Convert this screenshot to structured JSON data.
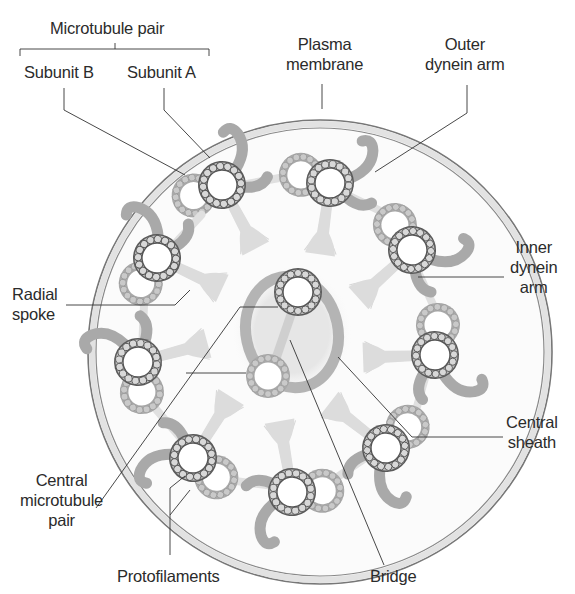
{
  "diagram": {
    "colors": {
      "membrane_fill": "#e6e6e6",
      "membrane_stroke": "#777777",
      "doublet_a_ring": "#555555",
      "doublet_b_ring": "#a8a8a8",
      "dynein_arm": "#a9a9a9",
      "spoke": "#dcdcdc",
      "leader_line": "#333333",
      "text": "#2b2b2b"
    },
    "labels": {
      "microtubule_pair": "Microtubule pair",
      "subunit_b": "Subunit B",
      "subunit_a": "Subunit A",
      "plasma_membrane": [
        "Plasma",
        "membrane"
      ],
      "outer_dynein_arm": [
        "Outer",
        "dynein arm"
      ],
      "inner_dynein_arm": [
        "Inner",
        "dynein",
        "arm"
      ],
      "radial_spoke": [
        "Radial",
        "spoke"
      ],
      "central_sheath": [
        "Central",
        "sheath"
      ],
      "central_microtubule_pair": [
        "Central",
        "microtubule",
        "pair"
      ],
      "protofilaments": "Protofilaments",
      "bridge": "Bridge"
    },
    "structure": {
      "peripheral_doublets": 9,
      "central_singlets": 2
    }
  }
}
